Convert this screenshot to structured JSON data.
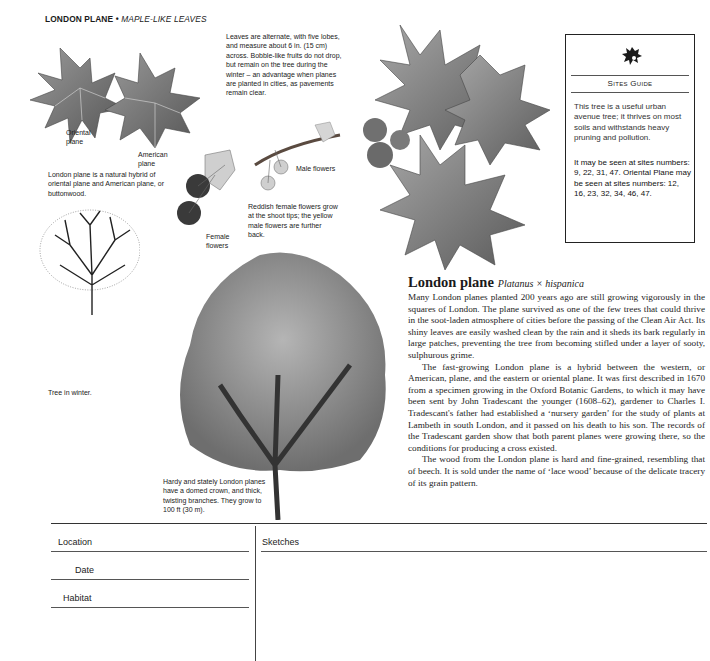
{
  "header": {
    "title": "LONDON PLANE",
    "separator": "•",
    "subtitle": "MAPLE-LIKE LEAVES"
  },
  "captions": {
    "leaves": "Leaves are alternate, with five lobes, and measure about 6 in. (15 cm) across. Bobble-like fruits do not drop, but remain on the tree during the winter – an advantage when planes are planted in cities, as pavements remain clear.",
    "oriental_plane": "Oriental plane",
    "american_plane": "American plane",
    "hybrid": "London plane is a natural hybrid of oriental plane and American plane, or buttonwood.",
    "male_flowers": "Male flowers",
    "female_flowers": "Female flowers",
    "flowers": "Reddish female flowers grow at the shoot tips; the yellow male flowers are further back.",
    "winter": "Tree in winter.",
    "summer": "Hardy and stately London planes have a domed crown, and thick, twisting branches. They grow to 100 ft (30 m)."
  },
  "sites_guide": {
    "icon": "oak-leaf-logo-icon",
    "title": "Sites Guide",
    "description": "This tree is a useful urban avenue tree; it thrives on most soils and withstands heavy pruning and pollution.",
    "sites": "It may be seen at sites numbers: 9, 22, 31, 47. Oriental Plane may be seen at sites numbers: 12, 16, 23, 32, 34, 46, 47."
  },
  "article": {
    "common_name": "London plane",
    "latin_name": "Platanus × hispanica",
    "paragraphs": [
      "Many London planes planted 200 years ago are still growing vigorously in the squares of London. The plane survived as one of the few trees that could thrive in the soot-laden atmosphere of cities before the passing of the Clean Air Act. Its shiny leaves are easily washed clean by the rain and it sheds its bark regularly in large patches, preventing the tree from becoming stifled under a layer of sooty, sulphurous grime.",
      "The fast-growing London plane is a hybrid between the western, or American, plane, and the eastern or oriental plane. It was first described in 1670 from a specimen growing in the Oxford Botanic Gardens, to which it may have been sent by John Tradescant the younger (1608–62), gardener to Charles I. Tradescant's father had established a ‘nursery garden’ for the study of plants at Lambeth in south London, and it passed on his death to his son. The records of the Tradescant garden show that both parent planes were growing there, so the conditions for producing a cross existed.",
      "The wood from the London plane is hard and fine-grained, resembling that of beech. It is sold under the name of ‘lace wood’ because of the delicate tracery of its grain pattern."
    ]
  },
  "form": {
    "location_label": "Location",
    "date_label": "Date",
    "habitat_label": "Habitat",
    "sketches_label": "Sketches",
    "location_value": "",
    "date_value": "",
    "habitat_value": ""
  }
}
